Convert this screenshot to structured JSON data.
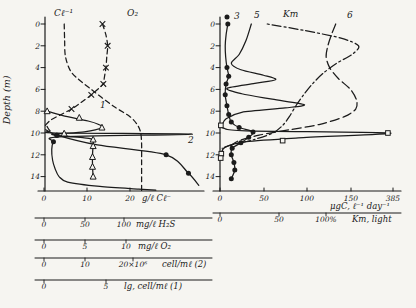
{
  "figure": {
    "bg": "#f6f5f1",
    "ink": "#1b1b1b",
    "width": 416,
    "height": 308,
    "depth": {
      "y0": 24,
      "px_per_m": 10.9,
      "axis_top_y": 17
    }
  },
  "chart_data": [
    {
      "id": "left",
      "type": "line",
      "description": "Depth profiles of hydrochemistry and microbial counts",
      "y_axis": {
        "x": 45,
        "label": "Depth (m)",
        "label_x": 10,
        "label_y": 100,
        "tick_label_x": 40,
        "ticks": [
          0,
          2,
          4,
          6,
          8,
          10,
          12,
          14
        ]
      },
      "x_axis": {
        "y": 191,
        "x_from": 38,
        "x_to": 204,
        "label_y": 201,
        "ticks": [
          {
            "t": "0",
            "x": 44
          },
          {
            "t": "10",
            "x": 87
          },
          {
            "t": "20",
            "x": 130
          }
        ],
        "unit": {
          "t": "g/ℓ Cℓ⁻",
          "x": 142
        }
      },
      "rulers": [
        {
          "y": 218,
          "x_from": 35,
          "x_to": 212,
          "label_y": 227,
          "ticks": [
            {
              "t": "0",
              "x": 44
            },
            {
              "t": "50",
              "x": 85
            },
            {
              "t": "100",
              "x": 124
            }
          ],
          "unit": {
            "t": "mg/ℓ H₂S",
            "x": 136
          }
        },
        {
          "y": 240,
          "x_from": 35,
          "x_to": 212,
          "label_y": 249,
          "ticks": [
            {
              "t": "0",
              "x": 44
            },
            {
              "t": "5",
              "x": 85
            },
            {
              "t": "10",
              "x": 126
            }
          ],
          "unit": {
            "t": "mg/ℓ O₂",
            "x": 138
          }
        },
        {
          "y": 258,
          "x_from": 35,
          "x_to": 212,
          "label_y": 267,
          "ticks": [
            {
              "t": "0",
              "x": 44
            },
            {
              "t": "10",
              "x": 85
            },
            {
              "t": "20×10⁶",
              "x": 133
            }
          ],
          "unit": {
            "t": "cell/mℓ (2)",
            "x": 162
          }
        },
        {
          "y": 280,
          "x_from": 35,
          "x_to": 212,
          "label_y": 289,
          "ticks": [
            {
              "t": "0",
              "x": 44
            },
            {
              "t": "5",
              "x": 106
            }
          ],
          "unit": {
            "t": "lg, cell/mℓ (1)",
            "x": 124
          }
        }
      ],
      "series": [
        {
          "name": "chloride",
          "label": "Cl⁻",
          "unit": "g/l",
          "line": "dashed",
          "dash": "5,3.5",
          "scale": {
            "x0": 44,
            "ppu": 4.3
          },
          "points": [
            [
              0,
              4.7
            ],
            [
              1.5,
              4.8
            ],
            [
              3,
              5.0
            ],
            [
              4.5,
              6.5
            ],
            [
              6,
              11
            ],
            [
              7.5,
              16
            ],
            [
              8.5,
              20
            ],
            [
              9.3,
              21.8
            ],
            [
              10,
              22.5
            ],
            [
              11,
              22.7
            ],
            [
              12.5,
              22.7
            ],
            [
              14,
              22.7
            ],
            [
              15.3,
              22.7
            ]
          ]
        },
        {
          "name": "oxygen",
          "label": "O₂",
          "unit": "mg/l",
          "line": "dashed",
          "dash": "5,3.5",
          "marker": "x",
          "scale": {
            "x0": 44,
            "ppu": 8.6
          },
          "points": [
            [
              0,
              6.8
            ],
            [
              1,
              7.2
            ],
            [
              2,
              7.4
            ],
            [
              3,
              7.3
            ],
            [
              4,
              7.2
            ],
            [
              5,
              7.0
            ],
            [
              5.5,
              6.9
            ],
            [
              6.5,
              5.5
            ],
            [
              7.2,
              4.3
            ],
            [
              7.8,
              3.2
            ],
            [
              8.3,
              2.0
            ],
            [
              8.8,
              0.8
            ],
            [
              9.3,
              0.15
            ]
          ],
          "markers": [
            [
              0,
              6.8
            ],
            [
              2,
              7.4
            ],
            [
              4,
              7.2
            ],
            [
              5.5,
              6.9
            ],
            [
              6.5,
              5.5
            ],
            [
              7.8,
              3.2
            ]
          ]
        },
        {
          "name": "hydrogen-sulfide",
          "unit": "mg/l",
          "line": "solid",
          "marker": "dot",
          "scale": {
            "x0": 44,
            "ppu": 0.86
          },
          "points": [
            [
              9.7,
              2
            ],
            [
              10.2,
              15
            ],
            [
              11.1,
              62
            ],
            [
              12,
              142
            ],
            [
              13.7,
              168
            ],
            [
              14.8,
              180
            ]
          ],
          "markers": [
            [
              10.2,
              15
            ],
            [
              12,
              142
            ],
            [
              13.7,
              168
            ]
          ]
        },
        {
          "name": "total-bacteria",
          "label": "2",
          "unit": "1e6 cell/ml",
          "line": "solid",
          "marker": "dot",
          "scale": {
            "x0": 44,
            "ppu": 4.3
          },
          "points": [
            [
              9.4,
              0.7
            ],
            [
              9.8,
              1.4
            ],
            [
              10.0,
              2.8
            ],
            [
              10.1,
              34.5
            ],
            [
              10.35,
              3.6
            ],
            [
              10.8,
              2.2
            ],
            [
              11.5,
              1.8
            ],
            [
              12.5,
              2.0
            ],
            [
              13.3,
              2.6
            ],
            [
              14.0,
              3.5
            ],
            [
              14.5,
              5.5
            ],
            [
              14.9,
              13
            ],
            [
              15.15,
              22
            ],
            [
              15.25,
              26
            ]
          ],
          "markers": [
            [
              10.2,
              3
            ],
            [
              10.8,
              2.2
            ]
          ]
        },
        {
          "name": "lg-cells",
          "label": "1",
          "unit": "lg cell/ml",
          "line": "solid",
          "marker": "tri",
          "scale": {
            "x0": 44,
            "ppu": 12.6
          },
          "points": [
            [
              8,
              0.25
            ],
            [
              8.4,
              1.5
            ],
            [
              8.9,
              3.5
            ],
            [
              9.2,
              4.3
            ],
            [
              9.5,
              4.6
            ],
            [
              9.9,
              3.2
            ],
            [
              10.15,
              0.6
            ],
            [
              10.45,
              3.2
            ],
            [
              10.6,
              3.9
            ],
            [
              11,
              3.9
            ],
            [
              12,
              3.85
            ],
            [
              13,
              3.85
            ],
            [
              14,
              3.9
            ]
          ],
          "markers": [
            [
              8,
              0.25
            ],
            [
              8.6,
              2.8
            ],
            [
              9.5,
              4.6
            ],
            [
              10.05,
              1.6
            ],
            [
              10.6,
              3.9
            ],
            [
              11.2,
              3.9
            ],
            [
              12.2,
              3.85
            ],
            [
              13.1,
              3.85
            ],
            [
              14,
              3.9
            ]
          ]
        }
      ],
      "annotations": [
        {
          "t": "Cℓ⁻¹",
          "x": 54,
          "y": 16,
          "size": 9
        },
        {
          "t": "O₂",
          "x": 127,
          "y": 16,
          "size": 9
        },
        {
          "t": "1",
          "x": 100,
          "y": 108,
          "size": 9
        },
        {
          "t": "2",
          "x": 188,
          "y": 143,
          "size": 9
        }
      ]
    },
    {
      "id": "right",
      "type": "line",
      "description": "Depth profiles of carbon assimilation and light",
      "axis_break_label": "385",
      "y_axis": {
        "x": 220,
        "tick_label_x": 215,
        "ticks": [
          0,
          2,
          4,
          6,
          8,
          10,
          12,
          14
        ]
      },
      "x_axis": {
        "y": 191,
        "x_from": 213,
        "x_to": 401,
        "label_y": 201,
        "ticks": [
          {
            "t": "0",
            "x": 220
          },
          {
            "t": "50",
            "x": 264
          },
          {
            "t": "100",
            "x": 307
          },
          {
            "t": "150",
            "x": 351
          },
          {
            "t": "385",
            "x": 393
          }
        ],
        "unit": {
          "t": "μgC, ℓ⁻¹ day⁻¹",
          "x": 330,
          "y": 209
        }
      },
      "rulers": [
        {
          "y": 213,
          "x_from": 213,
          "x_to": 401,
          "label_y": 222,
          "ticks": [
            {
              "t": "0",
              "x": 220
            },
            {
              "t": "50",
              "x": 279
            },
            {
              "t": "100%",
              "x": 326
            }
          ],
          "unit": {
            "t": "Kт, light",
            "x": 352
          }
        }
      ],
      "series": [
        {
          "name": "dark-assimilation",
          "label": "3",
          "unit": "ugC/l/day",
          "line": "solid",
          "marker": "dot",
          "scale": {
            "x0": 220,
            "ppu": 0.87
          },
          "points": [
            [
              0,
              9
            ],
            [
              1,
              7
            ],
            [
              2,
              6
            ],
            [
              3,
              6.5
            ],
            [
              4,
              8
            ],
            [
              4.8,
              10
            ],
            [
              5.5,
              7
            ],
            [
              6.5,
              6
            ],
            [
              7.5,
              8
            ],
            [
              8.3,
              10
            ],
            [
              9,
              13
            ],
            [
              9.5,
              22
            ],
            [
              9.9,
              38
            ],
            [
              10.4,
              33
            ],
            [
              10.9,
              24
            ],
            [
              11.4,
              14
            ],
            [
              12,
              13
            ],
            [
              12.7,
              16
            ],
            [
              13.4,
              17
            ],
            [
              14.2,
              13
            ]
          ],
          "markers": [
            [
              0,
              9
            ],
            [
              4,
              8
            ],
            [
              4.8,
              10
            ],
            [
              5.5,
              7
            ],
            [
              6.5,
              6
            ],
            [
              7.5,
              8
            ],
            [
              8.3,
              10
            ],
            [
              9,
              13
            ],
            [
              9.5,
              22
            ],
            [
              9.9,
              38
            ],
            [
              10.4,
              33
            ],
            [
              10.9,
              24
            ],
            [
              11.4,
              14
            ],
            [
              12,
              13
            ],
            [
              12.7,
              16
            ],
            [
              13.4,
              17
            ],
            [
              14.2,
              13
            ]
          ]
        },
        {
          "name": "photosynthesis-phytoplankton",
          "label": "5",
          "unit": "ugC/l/day",
          "line": "solid",
          "scale": {
            "x0": 220,
            "ppu": 0.87
          },
          "points": [
            [
              0,
              36
            ],
            [
              1.5,
              30
            ],
            [
              2.8,
              22
            ],
            [
              3.6,
              13
            ],
            [
              4.2,
              24
            ],
            [
              4.7,
              50
            ],
            [
              5.1,
              64
            ],
            [
              5.45,
              40
            ],
            [
              5.9,
              8
            ],
            [
              6.4,
              25
            ],
            [
              6.9,
              60
            ],
            [
              7.4,
              97
            ],
            [
              7.7,
              75
            ],
            [
              8.1,
              25
            ],
            [
              8.7,
              7
            ],
            [
              9.3,
              2
            ]
          ]
        },
        {
          "name": "photosynthesis-bacterial-peak",
          "unit": "ugC/l/day",
          "line": "solid",
          "marker": "sq",
          "peak_value_label": "385",
          "scale": {
            "x0": 220,
            "ppu": 0.87
          },
          "points": [
            [
              9.2,
              0.5
            ],
            [
              9.55,
              4
            ],
            [
              9.8,
              30
            ],
            [
              10.0,
              196
            ],
            [
              10.45,
              90
            ],
            [
              10.8,
              30
            ],
            [
              11.3,
              6
            ],
            [
              11.9,
              1.5
            ],
            [
              12.3,
              0.8
            ]
          ],
          "markers": [
            [
              9.3,
              1
            ],
            [
              10.0,
              193
            ],
            [
              10.7,
              72
            ],
            [
              11.9,
              1.5
            ],
            [
              12.3,
              0.8
            ]
          ]
        },
        {
          "name": "kt-light",
          "label": "Kт",
          "unit": "%",
          "line": "dashdot",
          "dash": "2,3,9,3",
          "scale": {
            "x0": 220,
            "ppu": 1.1
          },
          "points": [
            [
              0,
              43
            ],
            [
              0.6,
              77
            ],
            [
              1.3,
              110
            ],
            [
              2,
              126
            ],
            [
              2.8,
              120
            ],
            [
              3.6,
              106
            ],
            [
              4.5,
              94
            ],
            [
              5.5,
              84
            ],
            [
              6.5,
              76
            ],
            [
              7.5,
              69
            ],
            [
              8.5,
              63
            ],
            [
              9.3,
              57
            ],
            [
              10,
              48
            ],
            [
              10.6,
              31
            ],
            [
              11.1,
              10
            ],
            [
              11.4,
              2
            ]
          ]
        },
        {
          "name": "curve-6",
          "label": "6",
          "line": "dashed",
          "dash": "9,4",
          "scale": {
            "x0": 220,
            "ppu": 0.87
          },
          "points": [
            [
              0,
              133
            ],
            [
              1,
              128
            ],
            [
              2,
              124
            ],
            [
              3,
              122
            ],
            [
              4,
              126
            ],
            [
              5,
              136
            ],
            [
              6,
              150
            ],
            [
              7,
              157
            ],
            [
              7.8,
              156
            ],
            [
              8.5,
              143
            ],
            [
              9.2,
              115
            ],
            [
              9.7,
              80
            ],
            [
              10.2,
              45
            ],
            [
              10.7,
              22
            ],
            [
              11.2,
              12
            ]
          ]
        }
      ],
      "annotations": [
        {
          "t": "3",
          "x": 234,
          "y": 19,
          "size": 9
        },
        {
          "t": "5",
          "x": 254,
          "y": 18,
          "size": 9
        },
        {
          "t": "Kт",
          "x": 283,
          "y": 17,
          "size": 9
        },
        {
          "t": "6",
          "x": 347,
          "y": 18,
          "size": 9
        }
      ],
      "annotation_markers": [
        {
          "shape": "dot",
          "x": 227,
          "y": 17
        }
      ]
    }
  ]
}
